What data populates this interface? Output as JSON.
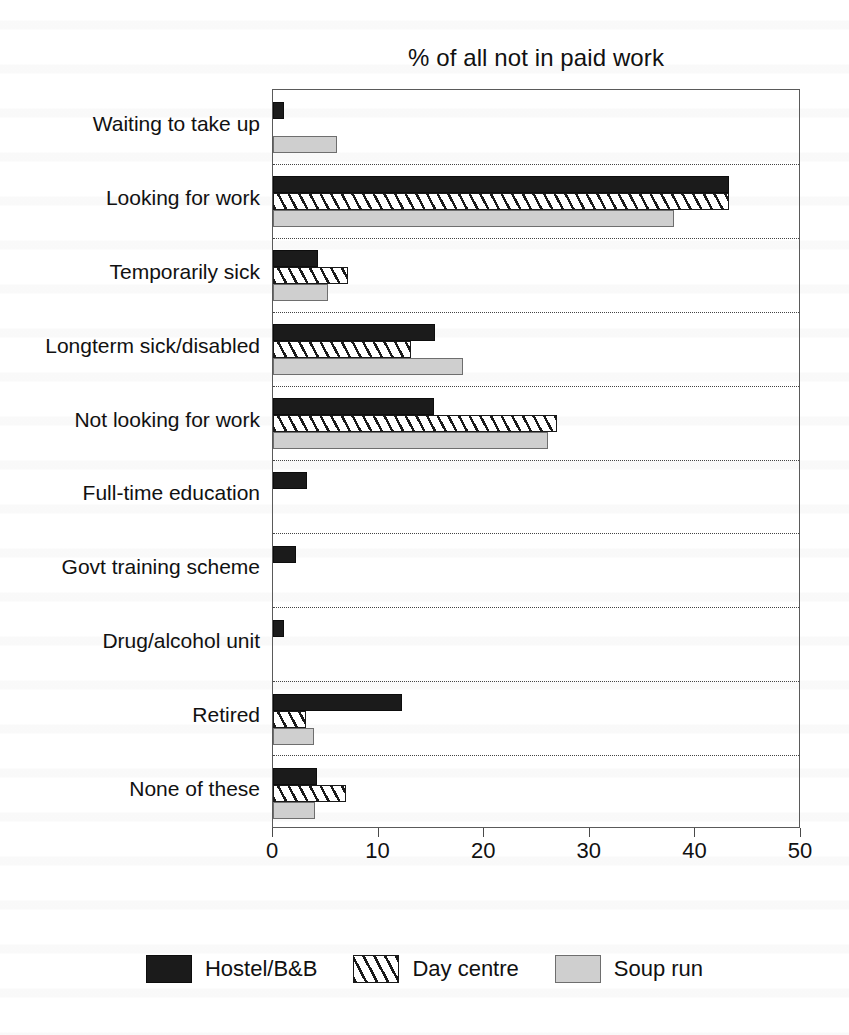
{
  "chart_data": {
    "type": "bar",
    "orientation": "horizontal",
    "title": "% of all not in paid work",
    "xlabel": "",
    "ylabel": "",
    "xlim": [
      0,
      50
    ],
    "xticks": [
      0,
      10,
      20,
      30,
      40,
      50
    ],
    "xtick_labels": [
      "0",
      "10",
      "20",
      "30",
      "40",
      "50"
    ],
    "grid": "dotted horizontal separators between category groups",
    "legend_position": "bottom-center",
    "categories": [
      "Waiting to take up",
      "Looking for work",
      "Temporarily sick",
      "Longterm sick/disabled",
      "Not looking for work",
      "Full-time education",
      "Govt training scheme",
      "Drug/alcohol unit",
      "Retired",
      "None of these"
    ],
    "series": [
      {
        "name": "Hostel/B&B",
        "color": "#1b1b1b",
        "fill": "solid-black",
        "values": [
          1.0,
          43.2,
          4.3,
          15.3,
          15.2,
          3.2,
          2.2,
          1.0,
          12.2,
          4.2
        ]
      },
      {
        "name": "Day centre",
        "color": "#ffffff",
        "fill": "diagonal-hatch",
        "values": [
          0,
          43.2,
          7.1,
          13.1,
          26.9,
          0,
          0,
          0,
          3.1,
          6.9
        ]
      },
      {
        "name": "Soup run",
        "color": "#cfcfcf",
        "fill": "light-grey",
        "values": [
          6.1,
          38.0,
          5.2,
          18.0,
          26.0,
          0,
          0,
          0,
          3.9,
          4.0
        ]
      }
    ]
  },
  "legend": {
    "items": [
      {
        "label": "Hostel/B&B",
        "swatch": "solid-black-swatch"
      },
      {
        "label": "Day centre",
        "swatch": "hatched-swatch"
      },
      {
        "label": "Soup run",
        "swatch": "grey-swatch"
      }
    ]
  }
}
